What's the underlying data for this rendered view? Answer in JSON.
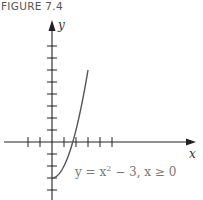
{
  "figure_label": "FIGURE 7.4",
  "chart_data": {
    "type": "line",
    "title": "",
    "xlabel": "x",
    "ylabel": "y",
    "xlim": [
      -4,
      8.5
    ],
    "ylim": [
      -5,
      8.5
    ],
    "x_ticks": [
      -2,
      -1,
      1,
      2,
      3,
      4,
      5
    ],
    "y_ticks": [
      -4,
      -3,
      -2,
      -1,
      1,
      2,
      3,
      4,
      5,
      6,
      7,
      8
    ],
    "grid": false,
    "series": [
      {
        "name": "y = x^2 - 3, x >= 0",
        "function": "x^2 - 3",
        "domain": [
          0,
          3
        ],
        "x": [
          0,
          0.5,
          1,
          1.5,
          2,
          2.5,
          3
        ],
        "y": [
          -3,
          -2.75,
          -2,
          -0.75,
          1,
          3.25,
          6
        ]
      }
    ],
    "annotations": [
      {
        "text_parts": [
          "y = x",
          "2",
          " − 3,   x ≥ 0"
        ],
        "near": "below-right of curve crossing"
      }
    ]
  }
}
